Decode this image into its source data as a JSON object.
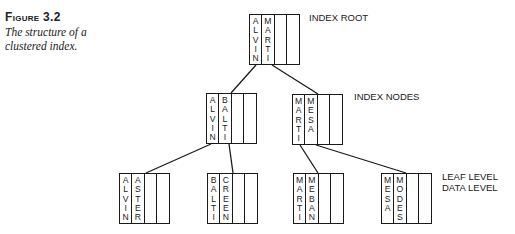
{
  "figure": {
    "label": "Figure 3.2",
    "caption_line1": "The structure of a",
    "caption_line2": "clustered index."
  },
  "labels": {
    "root": "INDEX ROOT",
    "index_nodes": "INDEX NODES",
    "leaf_line1": "LEAF LEVEL",
    "leaf_line2": "DATA LEVEL"
  },
  "tree": {
    "root": {
      "keys": [
        "ALVIN",
        "MARTI",
        "",
        ""
      ]
    },
    "index_nodes": [
      {
        "keys": [
          "ALVIN",
          "BALTI",
          "",
          ""
        ]
      },
      {
        "keys": [
          "MARTI",
          "MESA",
          "",
          ""
        ]
      }
    ],
    "leaves": [
      {
        "keys": [
          "ALVIN",
          "ASTER",
          "",
          ""
        ]
      },
      {
        "keys": [
          "BALTI",
          "CREEN",
          "",
          ""
        ]
      },
      {
        "keys": [
          "MARTI",
          "MEBAN",
          "",
          ""
        ]
      },
      {
        "keys": [
          "MESA",
          "MODES",
          "",
          ""
        ]
      }
    ]
  },
  "colors": {
    "line": "#1a1a1a",
    "background": "#ffffff"
  }
}
